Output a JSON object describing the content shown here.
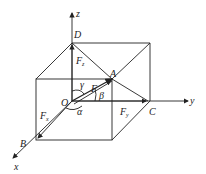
{
  "diagram": {
    "type": "3d force decomposition box",
    "axes": {
      "x": "x",
      "y": "y",
      "z": "z"
    },
    "points": {
      "origin": "O",
      "A": "A",
      "B": "B",
      "C": "C",
      "D": "D"
    },
    "force": {
      "main": "F",
      "x_comp": "F",
      "x_sub": "x",
      "y_comp": "F",
      "y_sub": "y",
      "z_comp": "F",
      "z_sub": "z"
    },
    "angles": {
      "alpha": "α",
      "beta": "β",
      "gamma": "γ"
    },
    "colors": {
      "line": "#222222",
      "background": "#ffffff"
    }
  }
}
